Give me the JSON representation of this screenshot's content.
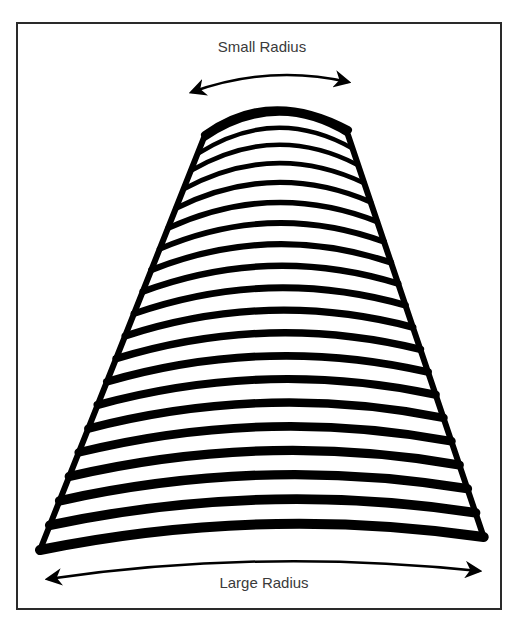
{
  "diagram": {
    "top_label": "Small Radius",
    "bottom_label": "Large Radius",
    "colors": {
      "ink": "#000000",
      "frame": "#2a2a2a",
      "text": "#3a3a3a",
      "background": "#ffffff"
    },
    "shape": "tapered coil / cone of stacked arcs",
    "arc_count": 20
  }
}
